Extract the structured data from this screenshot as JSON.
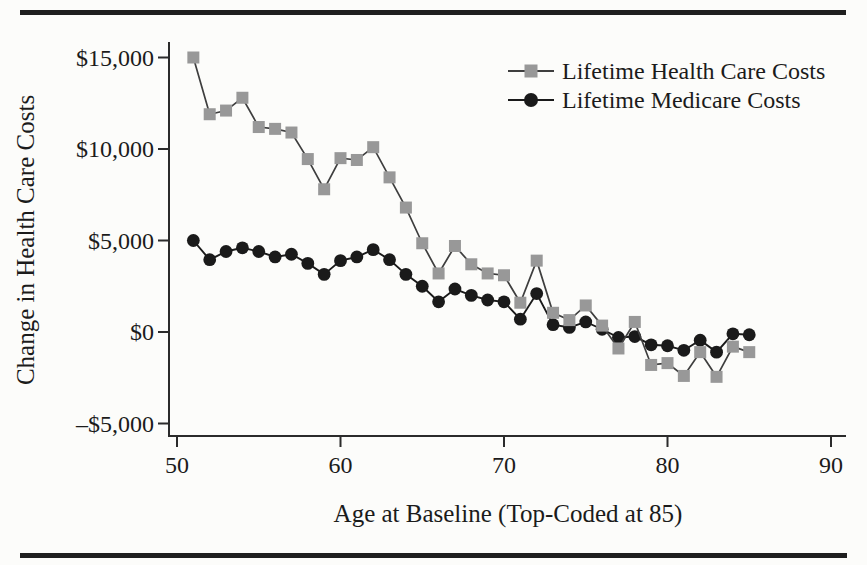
{
  "figure": {
    "kind": "scanned-book-line-chart",
    "background_color": "#fcfcfa",
    "rule_color": "#1f1f1f",
    "axis_color": "#2b2b2b",
    "text_color": "#1b1b1b"
  },
  "chart_data": {
    "type": "line",
    "title": "",
    "xlabel": "Age at Baseline (Top-Coded at 85)",
    "ylabel": "Change in Health Care Costs",
    "x": [
      51,
      52,
      53,
      54,
      55,
      56,
      57,
      58,
      59,
      60,
      61,
      62,
      63,
      64,
      65,
      66,
      67,
      68,
      69,
      70,
      71,
      72,
      73,
      74,
      75,
      76,
      77,
      78,
      79,
      80,
      81,
      82,
      83,
      84,
      85
    ],
    "series": [
      {
        "name": "Lifetime Health Care Costs",
        "marker": "square",
        "color": "#989898",
        "line_color": "#3e3e3e",
        "values": [
          15000,
          11900,
          12100,
          12800,
          11200,
          11100,
          10900,
          9450,
          7800,
          9500,
          9400,
          10100,
          8450,
          6800,
          4850,
          3200,
          4700,
          3700,
          3200,
          3100,
          1600,
          3900,
          1050,
          650,
          1450,
          350,
          -900,
          550,
          -1800,
          -1700,
          -2400,
          -1100,
          -2450,
          -800,
          -1100
        ]
      },
      {
        "name": "Lifetime Medicare Costs",
        "marker": "circle",
        "color": "#1a1a1a",
        "line_color": "#1a1a1a",
        "values": [
          5000,
          3950,
          4400,
          4600,
          4400,
          4100,
          4250,
          3750,
          3150,
          3900,
          4100,
          4500,
          3950,
          3150,
          2500,
          1650,
          2350,
          2000,
          1750,
          1650,
          700,
          2100,
          400,
          250,
          550,
          150,
          -300,
          -250,
          -700,
          -750,
          -1000,
          -450,
          -1100,
          -100,
          -150
        ]
      }
    ],
    "x_ticks": [
      {
        "value": 50,
        "label": "50"
      },
      {
        "value": 60,
        "label": "60"
      },
      {
        "value": 70,
        "label": "70"
      },
      {
        "value": 80,
        "label": "80"
      },
      {
        "value": 90,
        "label": "90"
      }
    ],
    "y_ticks": [
      {
        "value": 15000,
        "label": "$15,000"
      },
      {
        "value": 10000,
        "label": "$10,000"
      },
      {
        "value": 5000,
        "label": "$5,000"
      },
      {
        "value": 0,
        "label": "$0"
      },
      {
        "value": -5000,
        "label": "–$5,000"
      }
    ],
    "xlim": [
      49.5,
      91
    ],
    "ylim": [
      -5680,
      15850
    ],
    "grid": false,
    "legend_position": "top-right"
  }
}
